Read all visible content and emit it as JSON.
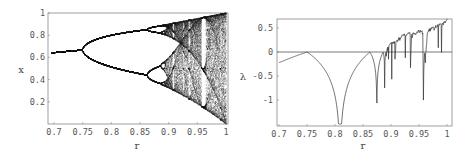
{
  "chart_data": [
    {
      "type": "scatter",
      "title": "",
      "description": "Bifurcation diagram of logistic map x -> 4 r x (1 - x)",
      "xlabel": "r",
      "ylabel": "x",
      "xlim": [
        0.7,
        1.0
      ],
      "ylim": [
        0.0,
        1.0
      ],
      "x_ticks": [
        "0.7",
        "0.75",
        "0.8",
        "0.85",
        "0.9",
        "0.95",
        "1"
      ],
      "y_ticks": [
        "0.2",
        "0.4",
        "0.6",
        "0.8",
        "1"
      ],
      "grid": false,
      "map": {
        "multiplier": 4,
        "r_start": 0.7,
        "r_end": 1.0,
        "transient": 300,
        "samples": 120
      },
      "key_points": [
        {
          "r": 0.7,
          "x": [
            0.643
          ]
        },
        {
          "r": 0.75,
          "x": [
            0.667
          ]
        },
        {
          "r": 0.86,
          "x": [
            0.44,
            0.84
          ]
        },
        {
          "r": 0.89,
          "x": [
            0.37,
            0.52,
            0.82,
            0.88
          ]
        },
        {
          "r": 1.0,
          "x": [
            0.0,
            1.0
          ]
        }
      ],
      "color": "#222222"
    },
    {
      "type": "line",
      "title": "",
      "description": "Lyapunov exponent of logistic map",
      "xlabel": "r",
      "ylabel": "λ",
      "xlim": [
        0.7,
        1.0
      ],
      "ylim": [
        -1.5,
        0.65
      ],
      "x_ticks": [
        "0.7",
        "0.75",
        "0.8",
        "0.85",
        "0.9",
        "0.95",
        "1"
      ],
      "y_ticks": [
        "0.5",
        "0",
        "-0.5",
        "-1"
      ],
      "zero_line": true,
      "grid": false,
      "map": {
        "multiplier": 4,
        "r_start": 0.7,
        "r_end": 1.0,
        "transient": 200,
        "iterations": 400,
        "steps": 520
      },
      "key_points": [
        {
          "r": 0.7,
          "lambda": -0.22
        },
        {
          "r": 0.75,
          "lambda": 0.0
        },
        {
          "r": 0.809,
          "lambda": -1.5
        },
        {
          "r": 0.862,
          "lambda": 0.0
        },
        {
          "r": 0.875,
          "lambda": -1.4
        },
        {
          "r": 0.957,
          "lambda": -1.3
        },
        {
          "r": 1.0,
          "lambda": 0.69
        }
      ],
      "color": "#333333"
    }
  ],
  "left_plot": {
    "xlabel": "r",
    "ylabel": "x",
    "x_ticks": [
      "0.7",
      "0.75",
      "0.8",
      "0.85",
      "0.9",
      "0.95",
      "1"
    ],
    "y_ticks": [
      "0.2",
      "0.4",
      "0.6",
      "0.8",
      "1"
    ]
  },
  "right_plot": {
    "xlabel": "r",
    "ylabel": "λ",
    "x_ticks": [
      "0.7",
      "0.75",
      "0.8",
      "0.85",
      "0.9",
      "0.95",
      "1"
    ],
    "y_ticks": [
      "0.5",
      "0",
      "-0.5",
      "-1"
    ]
  }
}
